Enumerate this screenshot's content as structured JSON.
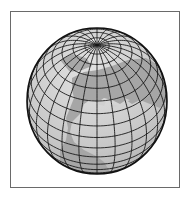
{
  "figure": {
    "colors": {
      "frame": "#6a6a6a",
      "ocean": "#c9c9c9",
      "land": "#a5a5a5",
      "grid": "#1a1a1a",
      "outline": "#111111",
      "pole_highlight": "#ececec"
    },
    "globe": {
      "cx": 97,
      "cy": 101,
      "rx": 70,
      "ry": 73,
      "tilt_deg": 40,
      "meridian_step_deg": 15,
      "parallel_step_deg": 10
    }
  }
}
